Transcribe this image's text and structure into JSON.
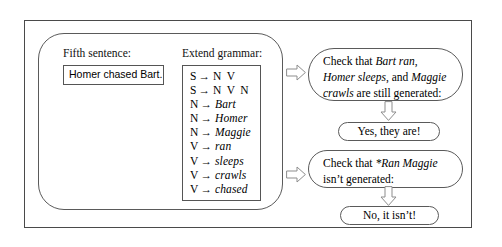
{
  "figure": {
    "name": "extend-grammar-walkthrough",
    "colors": {
      "frame_stroke": "#4a4a4a",
      "panel_stroke": "#5a5a5a",
      "box_stroke": "#555555",
      "arrow_stroke": "#888888",
      "arrow_fill": "#ffffff",
      "background": "#ffffff",
      "text": "#000000"
    }
  },
  "left_panel": {
    "sentence": {
      "label": "Fifth sentence:",
      "value": "Homer chased Bart."
    },
    "grammar": {
      "label": "Extend grammar:",
      "rules": [
        {
          "lhs": "S",
          "arrow": "→",
          "rhs": "N V",
          "rhs_italic": false
        },
        {
          "lhs": "S",
          "arrow": "→",
          "rhs": "N V N",
          "rhs_italic": false
        },
        {
          "lhs": "N",
          "arrow": "→",
          "rhs": "Bart",
          "rhs_italic": true
        },
        {
          "lhs": "N",
          "arrow": "→",
          "rhs": "Homer",
          "rhs_italic": true
        },
        {
          "lhs": "N",
          "arrow": "→",
          "rhs": "Maggie",
          "rhs_italic": true
        },
        {
          "lhs": "V",
          "arrow": "→",
          "rhs": "ran",
          "rhs_italic": true
        },
        {
          "lhs": "V",
          "arrow": "→",
          "rhs": "sleeps",
          "rhs_italic": true
        },
        {
          "lhs": "V",
          "arrow": "→",
          "rhs": "crawls",
          "rhs_italic": true
        },
        {
          "lhs": "V",
          "arrow": "→",
          "rhs": "chased",
          "rhs_italic": true
        }
      ]
    }
  },
  "checks": [
    {
      "prompt_parts": [
        {
          "text": "Check that ",
          "italic": false
        },
        {
          "text": "Bart ran",
          "italic": true
        },
        {
          "text": ", ",
          "italic": false
        },
        {
          "text": "Homer sleeps",
          "italic": true
        },
        {
          "text": ", and ",
          "italic": false
        },
        {
          "text": "Maggie crawls",
          "italic": true
        },
        {
          "text": " are still generated:",
          "italic": false
        }
      ],
      "prompt_plain": "Check that Bart ran, Homer sleeps, and Maggie crawls are still generated:",
      "answer": "Yes, they are!"
    },
    {
      "prompt_parts": [
        {
          "text": "Check that ",
          "italic": false
        },
        {
          "text": "*Ran Maggie",
          "italic": true
        },
        {
          "text": " isn’t generated:",
          "italic": false
        }
      ],
      "prompt_plain": "Check that *Ran Maggie isn’t generated:",
      "answer": "No, it isn’t!"
    }
  ]
}
